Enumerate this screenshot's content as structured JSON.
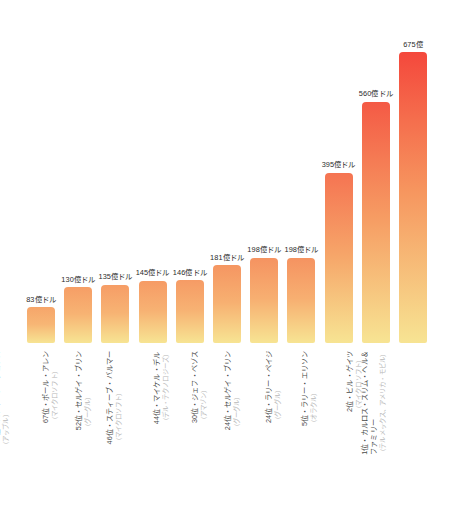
{
  "chart_data": {
    "type": "bar",
    "title": "",
    "subtitle": "",
    "xlabel": "",
    "ylabel": "",
    "ylim": [
      0,
      700
    ],
    "grid": false,
    "legend": "none",
    "orientation": "vertical",
    "unit": "億ドル",
    "categories": [
      "110位・スティーブ・ジョブズ",
      "67位・ポール・アレン",
      "52位・セルゲイ・ブリン",
      "46位・スティーブ・バルマー",
      "44位・マイケル・デル",
      "30位・ジェフ・ベゾス",
      "24位・セルゲイ・ブリン",
      "24位・ラリー・ペイジ",
      "5位・ラリー・エリソン",
      "2位・ビル・ゲイツ",
      "1位・カルロス・スリム・ヘル＆ファミリー"
    ],
    "values": [
      83,
      130,
      135,
      145,
      146,
      181,
      198,
      198,
      395,
      560,
      675
    ],
    "value_labels": [
      "83億ドル",
      "130億ドル",
      "135億ドル",
      "145億ドル",
      "146億ドル",
      "181億ドル",
      "198億ドル",
      "198億ドル",
      "395億ドル",
      "560億ドル",
      "675億"
    ],
    "bars": [
      {
        "rank": "110位",
        "person": "110位・スティーブ・ジョブズ",
        "company": "（アップル）",
        "value": 83,
        "value_label": "83億ドル"
      },
      {
        "rank": "67位",
        "person": "67位・ポール・アレン",
        "company": "（マイクロソフト）",
        "value": 130,
        "value_label": "130億ドル"
      },
      {
        "rank": "52位",
        "person": "52位・セルゲイ・ブリン",
        "company": "（グーグル）",
        "value": 135,
        "value_label": "135億ドル"
      },
      {
        "rank": "46位",
        "person": "46位・スティーブ・バルマー",
        "company": "（マイクロソフト）",
        "value": 145,
        "value_label": "145億ドル"
      },
      {
        "rank": "44位",
        "person": "44位・マイケル・デル",
        "company": "（デル・テクノロジーズ）",
        "value": 146,
        "value_label": "146億ドル"
      },
      {
        "rank": "30位",
        "person": "30位・ジェフ・ベゾス",
        "company": "（アマゾン）",
        "value": 181,
        "value_label": "181億ドル"
      },
      {
        "rank": "24位",
        "person": "24位・セルゲイ・ブリン",
        "company": "（グーグル）",
        "value": 198,
        "value_label": "198億ドル"
      },
      {
        "rank": "24位",
        "person": "24位・ラリー・ペイジ",
        "company": "（グーグル）",
        "value": 198,
        "value_label": "198億ドル"
      },
      {
        "rank": "5位",
        "person": "5位・ラリー・エリソン",
        "company": "（オラクル）",
        "value": 395,
        "value_label": "395億ドル"
      },
      {
        "rank": "2位",
        "person": "2位・ビル・ゲイツ",
        "company": "（マイクロソフト）",
        "value": 560,
        "value_label": "560億ドル"
      },
      {
        "rank": "1位",
        "person": "1位・カルロス・スリム・ヘル＆",
        "person2": "ファミリー",
        "company": "（テルメックス、アメリカ・モビル）",
        "value": 675,
        "value_label": "675億"
      }
    ],
    "colors": {
      "gradient_top_low": "#F6AE6E",
      "gradient_top_high": "#F4483C",
      "gradient_bottom": "#F7E493",
      "value_label_text": "#2b2b2b",
      "person_label_text": "#4a4a4a",
      "company_label_text": "#b8b8b8",
      "background": "#ffffff"
    }
  }
}
